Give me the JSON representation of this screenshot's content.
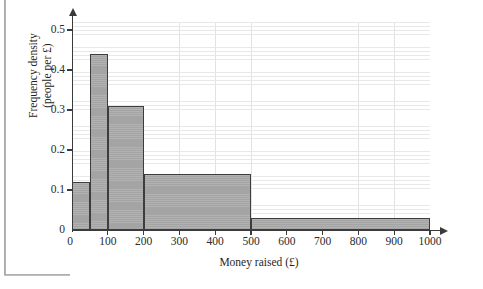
{
  "chart_data": {
    "type": "bar",
    "title": "",
    "xlabel": "Money raised (£)",
    "ylabel_line1": "Frequency density",
    "ylabel_line2": "(people per £)",
    "xlim": [
      0,
      1000
    ],
    "ylim": [
      0,
      0.52
    ],
    "grid": true,
    "legend": "none",
    "x_ticks": [
      "0",
      "100",
      "200",
      "300",
      "400",
      "500",
      "600",
      "700",
      "800",
      "900",
      "1000"
    ],
    "x_tick_values": [
      0,
      100,
      200,
      300,
      400,
      500,
      600,
      700,
      800,
      900,
      1000
    ],
    "y_ticks": [
      "0",
      "0.1",
      "0.2",
      "0.3",
      "0.4",
      "0.5"
    ],
    "y_tick_values": [
      0,
      0.1,
      0.2,
      0.3,
      0.4,
      0.5
    ],
    "bars": [
      {
        "label": "0-50",
        "x_start": 0,
        "x_end": 50,
        "value": 0.12
      },
      {
        "label": "50-100",
        "x_start": 50,
        "x_end": 100,
        "value": 0.44
      },
      {
        "label": "100-200",
        "x_start": 100,
        "x_end": 200,
        "value": 0.31
      },
      {
        "label": "200-500",
        "x_start": 200,
        "x_end": 500,
        "value": 0.14
      },
      {
        "label": "500-1000",
        "x_start": 500,
        "x_end": 1000,
        "value": 0.03
      }
    ],
    "bar_fill_color": "#a9a9a9",
    "bar_edge_color": "#3d3d3d",
    "axis_color": "#3a3a3a",
    "grid_color": "#e8e8e8"
  }
}
